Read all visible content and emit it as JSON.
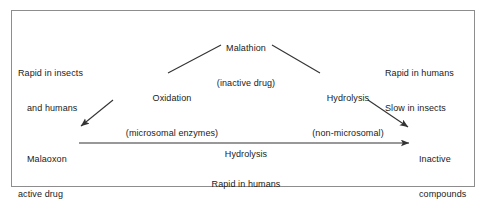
{
  "diagram": {
    "title_context": "Malathion metabolism pathway",
    "frame": {
      "border_color": "#8d8d8d",
      "background": "#ffffff"
    },
    "nodes": {
      "malathion": {
        "line1": "Malathion",
        "line2": "(inactive drug)"
      },
      "oxidation": {
        "line1": "Oxidation",
        "line2": "(microsomal enzymes)"
      },
      "hydrolysis_branch": {
        "line1": "Hydrolysis",
        "line2": "(non-microsomal)"
      },
      "malaoxon": {
        "line1": "Malaoxon",
        "line2": "active drug"
      },
      "inactive_compounds": {
        "line1": "Inactive",
        "line2": "compounds"
      }
    },
    "annotations": {
      "left_top": {
        "line1": "Rapid in insects",
        "line2": "and humans"
      },
      "right_top": {
        "line1": "Rapid in humans",
        "line2": "Slow in insects"
      },
      "mid_arrow": {
        "line1": "Hydrolysis"
      },
      "bottom": {
        "line1": "Rapid in humans",
        "line2": "Slow in insects"
      }
    },
    "connectors": [
      {
        "name": "malathion-to-oxidation",
        "from": [
          221,
          45
        ],
        "to": [
          168,
          73
        ],
        "arrowhead": false
      },
      {
        "name": "malathion-to-hydrolysis",
        "from": [
          272,
          45
        ],
        "to": [
          320,
          73
        ],
        "arrowhead": false
      },
      {
        "name": "oxidation-to-malaoxon",
        "from": [
          113,
          100
        ],
        "to": [
          79,
          127
        ],
        "arrowhead": true
      },
      {
        "name": "hydrolysis-to-inactive",
        "from": [
          368,
          100
        ],
        "to": [
          410,
          128
        ],
        "arrowhead": true
      },
      {
        "name": "malaoxon-to-inactive",
        "from": [
          79,
          143
        ],
        "to": [
          411,
          143
        ],
        "arrowhead": true
      }
    ],
    "stroke_color": "#333333"
  }
}
